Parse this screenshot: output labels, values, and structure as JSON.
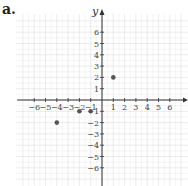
{
  "label": "a.",
  "chart_data": {
    "type": "scatter",
    "title": "",
    "xlabel": "x",
    "ylabel": "y",
    "xlim": [
      -6,
      6
    ],
    "ylim": [
      -6,
      6
    ],
    "grid": true,
    "x_ticks": [
      -6,
      -5,
      -4,
      -3,
      -2,
      -1,
      1,
      2,
      3,
      4,
      5,
      6
    ],
    "y_ticks": [
      -6,
      -5,
      -4,
      -3,
      -2,
      -1,
      1,
      2,
      3,
      4,
      5,
      6
    ],
    "points": [
      {
        "x": 1,
        "y": 2
      },
      {
        "x": -2,
        "y": -1
      },
      {
        "x": -1,
        "y": -1
      },
      {
        "x": -4,
        "y": -2
      }
    ],
    "colors": {
      "point": "#555555",
      "axis": "#333333",
      "grid": "#dddddd"
    }
  }
}
